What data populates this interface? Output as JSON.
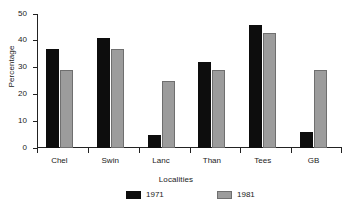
{
  "chart_data": {
    "type": "bar",
    "title": "",
    "xlabel": "Localities",
    "ylabel": "Percentage",
    "categories": [
      "Chel",
      "Swin",
      "Lanc",
      "Than",
      "Tees",
      "GB"
    ],
    "series": [
      {
        "name": "1971",
        "color": "#0d0d0d",
        "values": [
          37,
          41,
          5,
          32,
          46,
          6
        ]
      },
      {
        "name": "1981",
        "color": "#9c9c9c",
        "values": [
          29,
          37,
          25,
          29,
          43,
          29
        ]
      }
    ],
    "ylim": [
      0,
      50
    ],
    "yticks": [
      0,
      10,
      20,
      30,
      40,
      50
    ],
    "ytick_labels": [
      "0",
      "10",
      "20",
      "30",
      "40",
      "50"
    ],
    "grid": false,
    "legend_position": "bottom-center"
  },
  "axes": {
    "y_title": "Percentage",
    "x_title": "Localities"
  },
  "legend": {
    "entries": [
      {
        "label": "1971"
      },
      {
        "label": "1981"
      }
    ]
  }
}
